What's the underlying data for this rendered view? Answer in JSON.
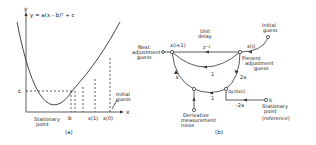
{
  "panel_a": {
    "axis_y": "y",
    "axis_x": "x",
    "equation": "y = a(x - b)² + c",
    "label_c": "c",
    "label_b": "b",
    "label_x1": "x(1)",
    "label_x0": "x(0)",
    "stationary_line1": "Stationary",
    "stationary_line2": "point",
    "initial_line1": "Initial",
    "initial_line2": "guess",
    "caption": "(a)"
  },
  "panel_b": {
    "next_line1": "Next",
    "next_line2": "adjustment",
    "next_line3": "guess",
    "x_next": "x(i+1)",
    "unit_line1": "Unit",
    "unit_line2": "delay",
    "z_inv": "z⁻¹",
    "x_i": "x(i)",
    "initial_line1": "Initial",
    "initial_line2": "guess",
    "present_line1": "Present",
    "present_line2": "adjustment",
    "present_line3": "guess",
    "gain_k": "k",
    "gain_1a": "1",
    "gain_2a": "2a",
    "gain_1b": "1",
    "deriv": "dy/dx(i)",
    "gain_neg2a": "-2a",
    "b_node": "b",
    "stat_line1": "Stationary",
    "stat_line2": "point",
    "stat_line3": "(reference)",
    "noise_line1": "Derivative",
    "noise_line2": "measurement",
    "noise_line3": "noise",
    "caption": "(b)"
  }
}
